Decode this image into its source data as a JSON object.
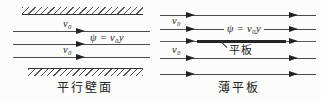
{
  "diagram": {
    "left_panel": {
      "v0_upper_label": "v₀",
      "v0_lower_label": "v₀",
      "stream_function_label": "ψ = v₀y",
      "caption": "平行壁面"
    },
    "right_panel": {
      "v0_upper_label": "v₀",
      "v0_lower_label": "v₀",
      "stream_function_label": "ψ = v₀y",
      "plate_label": "平板",
      "caption": "薄平板"
    },
    "colors": {
      "background": "#fcfcfc",
      "line": "#4a4a4a",
      "plate": "#242424",
      "text": "#1a1a1a"
    }
  }
}
